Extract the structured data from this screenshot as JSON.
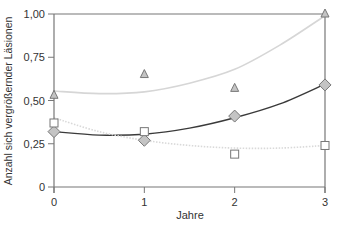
{
  "chart_data": {
    "type": "scatter",
    "title": "",
    "xlabel": "Jahre",
    "ylabel": "Anzahl sich vergrößernder Läsionen",
    "x": [
      0,
      1,
      2,
      3
    ],
    "xlim": [
      0,
      3
    ],
    "ylim": [
      0,
      1.0
    ],
    "x_ticks": [
      "0",
      "1",
      "2",
      "3"
    ],
    "y_ticks": [
      "0",
      "0,25",
      "0,50",
      "0,75",
      "1,00"
    ],
    "y_tick_values": [
      0,
      0.25,
      0.5,
      0.75,
      1.0
    ],
    "grid": false,
    "legend": null,
    "series": [
      {
        "name": "triangle",
        "marker": "triangle",
        "values": [
          0.53,
          0.65,
          0.57,
          1.0
        ],
        "fit_curve": {
          "style": "solid",
          "color": "#d6d6d6",
          "points": [
            [
              0,
              0.555
            ],
            [
              0.5,
              0.54
            ],
            [
              1,
              0.55
            ],
            [
              1.5,
              0.6
            ],
            [
              2,
              0.68
            ],
            [
              2.5,
              0.82
            ],
            [
              3,
              0.99
            ]
          ]
        }
      },
      {
        "name": "diamond",
        "marker": "diamond",
        "values": [
          0.32,
          0.27,
          0.41,
          0.59
        ],
        "fit_curve": {
          "style": "solid",
          "color": "#3a3a3a",
          "points": [
            [
              0,
              0.32
            ],
            [
              0.5,
              0.3
            ],
            [
              1,
              0.305
            ],
            [
              1.5,
              0.34
            ],
            [
              2,
              0.4
            ],
            [
              2.5,
              0.48
            ],
            [
              3,
              0.595
            ]
          ]
        }
      },
      {
        "name": "square",
        "marker": "square",
        "values": [
          0.37,
          0.32,
          0.19,
          0.24
        ],
        "fit_curve": {
          "style": "dotted",
          "color": "#d9d9d9",
          "points": [
            [
              0,
              0.4
            ],
            [
              0.5,
              0.32
            ],
            [
              1,
              0.27
            ],
            [
              1.5,
              0.24
            ],
            [
              2,
              0.225
            ],
            [
              2.5,
              0.225
            ],
            [
              3,
              0.24
            ]
          ]
        }
      }
    ]
  },
  "colors": {
    "axis": "#777777",
    "marker_fill": "#c4c4c4",
    "marker_stroke": "#777777",
    "square_fill": "#ffffff"
  }
}
